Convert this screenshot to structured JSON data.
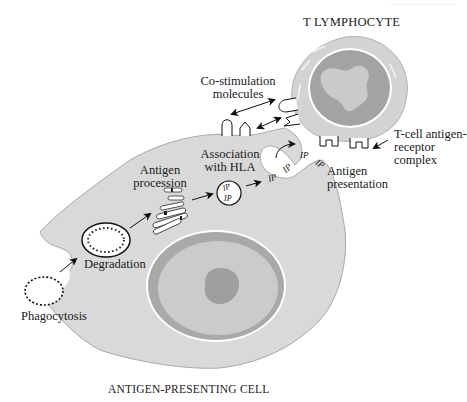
{
  "diagram": {
    "title_top": "T LYMPHOCYTE",
    "title_bottom": "ANTIGEN-PRESENTING CELL",
    "corner_text": "·························",
    "colors": {
      "cell_fill": "#d9d9d9",
      "cell_stroke": "#a8a8a8",
      "nucleus_outer": "#a8a8a8",
      "nucleus_inner": "#c9c9c9",
      "nucleolus": "#a0a0a0",
      "lymph_nucleus": "#a3a3a3",
      "lymph_chromatin": "#cacaca",
      "arrow": "#111111"
    },
    "labels": {
      "costim_line1": "Co-stimulation",
      "costim_line2": "molecules",
      "tcr_line1": "T-cell antigen-",
      "tcr_line2": "receptor",
      "tcr_line3": "complex",
      "assoc_line1": "Association",
      "assoc_line2": "with HLA",
      "proc_line1": "Antigen",
      "proc_line2": "procession",
      "present_line1": "Antigen",
      "present_line2": "presentation",
      "degradation": "Degradation",
      "phagocytosis": "Phagocytosis"
    },
    "steps": [
      "Phagocytosis",
      "Degradation",
      "Antigen procession",
      "Association with HLA",
      "Antigen presentation"
    ],
    "marker_text": "IP"
  }
}
